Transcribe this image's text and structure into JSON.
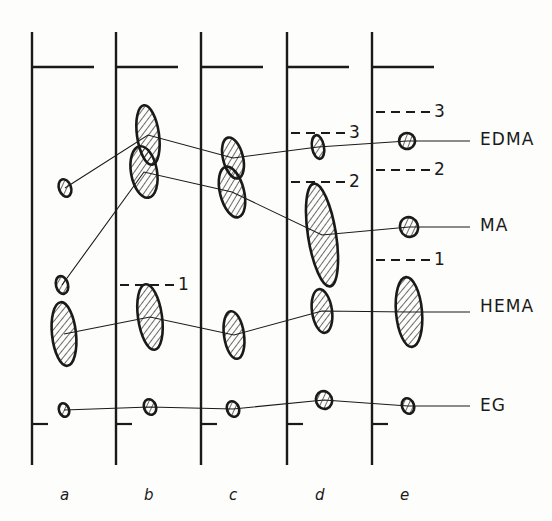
{
  "figure": {
    "type": "chromatogram-lane-diagram",
    "background": "#fdfdfb",
    "ink": "#1a1a1a"
  },
  "lanes": [
    {
      "id": "a",
      "label": "a",
      "x": 32
    },
    {
      "id": "b",
      "label": "b",
      "x": 116
    },
    {
      "id": "c",
      "label": "c",
      "x": 201
    },
    {
      "id": "d",
      "label": "d",
      "x": 287
    },
    {
      "id": "e",
      "label": "e",
      "x": 372
    }
  ],
  "analyte_labels": [
    {
      "name": "EDMA",
      "y": 141
    },
    {
      "name": "MA",
      "y": 227
    },
    {
      "name": "HEMA",
      "y": 308
    },
    {
      "name": "EG",
      "y": 407
    }
  ],
  "reference_marks": [
    {
      "label": "1",
      "lane": "b",
      "y": 285
    },
    {
      "label": "3",
      "lane": "d",
      "y": 133
    },
    {
      "label": "2",
      "lane": "d",
      "y": 182
    },
    {
      "label": "3",
      "lane": "e",
      "y": 112
    },
    {
      "label": "2",
      "lane": "e",
      "y": 170
    },
    {
      "label": "1",
      "lane": "e",
      "y": 260
    }
  ],
  "chart_data": {
    "type": "scatter",
    "title": "",
    "xlabel": "",
    "ylabel": "",
    "categories": [
      "a",
      "b",
      "c",
      "d",
      "e"
    ],
    "series": [
      {
        "name": "EDMA",
        "spots": [
          {
            "lane": "a",
            "x": 65,
            "y": 188,
            "rx": 6,
            "ry": 9,
            "tilt": -20
          },
          {
            "lane": "b",
            "x": 148,
            "y": 135,
            "rx": 11,
            "ry": 30,
            "tilt": -8
          },
          {
            "lane": "c",
            "x": 233,
            "y": 158,
            "rx": 10,
            "ry": 21,
            "tilt": -14
          },
          {
            "lane": "d",
            "x": 318,
            "y": 147,
            "rx": 6,
            "ry": 12,
            "tilt": -10
          },
          {
            "lane": "e",
            "x": 407,
            "y": 141,
            "rx": 8,
            "ry": 8,
            "tilt": -25
          }
        ]
      },
      {
        "name": "MA",
        "spots": [
          {
            "lane": "a",
            "x": 62,
            "y": 285,
            "rx": 6,
            "ry": 9,
            "tilt": -15
          },
          {
            "lane": "b",
            "x": 144,
            "y": 172,
            "rx": 13,
            "ry": 26,
            "tilt": -10
          },
          {
            "lane": "c",
            "x": 232,
            "y": 192,
            "rx": 12,
            "ry": 26,
            "tilt": -14
          },
          {
            "lane": "d",
            "x": 322,
            "y": 235,
            "rx": 14,
            "ry": 52,
            "tilt": -9
          },
          {
            "lane": "e",
            "x": 409,
            "y": 227,
            "rx": 9,
            "ry": 10,
            "tilt": -20
          }
        ]
      },
      {
        "name": "HEMA",
        "spots": [
          {
            "lane": "a",
            "x": 64,
            "y": 334,
            "rx": 12,
            "ry": 32,
            "tilt": -6
          },
          {
            "lane": "b",
            "x": 150,
            "y": 317,
            "rx": 12,
            "ry": 33,
            "tilt": -8
          },
          {
            "lane": "c",
            "x": 234,
            "y": 335,
            "rx": 10,
            "ry": 24,
            "tilt": -8
          },
          {
            "lane": "d",
            "x": 322,
            "y": 311,
            "rx": 10,
            "ry": 22,
            "tilt": -8
          },
          {
            "lane": "e",
            "x": 409,
            "y": 312,
            "rx": 13,
            "ry": 35,
            "tilt": -5
          }
        ]
      },
      {
        "name": "EG",
        "spots": [
          {
            "lane": "a",
            "x": 64,
            "y": 410,
            "rx": 5,
            "ry": 7,
            "tilt": -20
          },
          {
            "lane": "b",
            "x": 150,
            "y": 407,
            "rx": 6,
            "ry": 8,
            "tilt": -20
          },
          {
            "lane": "c",
            "x": 233,
            "y": 409,
            "rx": 6,
            "ry": 8,
            "tilt": -20
          },
          {
            "lane": "d",
            "x": 324,
            "y": 400,
            "rx": 8,
            "ry": 9,
            "tilt": -20
          },
          {
            "lane": "e",
            "x": 408,
            "y": 406,
            "rx": 6,
            "ry": 8,
            "tilt": -20
          }
        ]
      }
    ],
    "label_anchor_x": 470,
    "grid": false,
    "legend": "right"
  }
}
